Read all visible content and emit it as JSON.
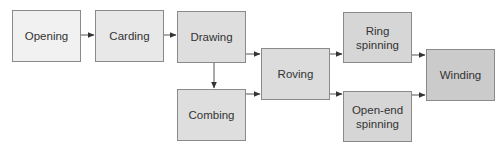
{
  "diagram": {
    "title": "",
    "nodes": [
      {
        "id": "opening",
        "label": "Opening",
        "x": 12,
        "y": 10,
        "w": 69,
        "h": 52,
        "fill": "#f1f1f1"
      },
      {
        "id": "carding",
        "label": "Carding",
        "x": 95,
        "y": 10,
        "w": 69,
        "h": 52,
        "fill": "#e8e8e8"
      },
      {
        "id": "drawing",
        "label": "Drawing",
        "x": 177,
        "y": 11,
        "w": 69,
        "h": 52,
        "fill": "#dedede"
      },
      {
        "id": "combing",
        "label": "Combing",
        "x": 177,
        "y": 89,
        "w": 69,
        "h": 52,
        "fill": "#dedede"
      },
      {
        "id": "roving",
        "label": "Roving",
        "x": 261,
        "y": 48,
        "w": 69,
        "h": 52,
        "fill": "#dcdcdc"
      },
      {
        "id": "ring_spinning",
        "label": "Ring\nspinning",
        "x": 343,
        "y": 12,
        "w": 69,
        "h": 51,
        "fill": "#d6d6d6"
      },
      {
        "id": "open_end_spinning",
        "label": "Open-end\nspinning",
        "x": 343,
        "y": 91,
        "w": 69,
        "h": 51,
        "fill": "#d6d6d6"
      },
      {
        "id": "winding",
        "label": "Winding",
        "x": 426,
        "y": 49,
        "w": 69,
        "h": 52,
        "fill": "#cbcbcb"
      }
    ],
    "edges": [
      {
        "from": "opening",
        "to": "carding"
      },
      {
        "from": "carding",
        "to": "drawing"
      },
      {
        "from": "drawing",
        "to": "combing"
      },
      {
        "from": "drawing",
        "to": "roving"
      },
      {
        "from": "combing",
        "to": "roving"
      },
      {
        "from": "roving",
        "to": "ring_spinning"
      },
      {
        "from": "roving",
        "to": "open_end_spinning"
      },
      {
        "from": "ring_spinning",
        "to": "winding"
      },
      {
        "from": "open_end_spinning",
        "to": "winding"
      }
    ],
    "colors": {
      "edge": "#444444",
      "border": "#8a8a8a",
      "text": "#333333"
    }
  }
}
